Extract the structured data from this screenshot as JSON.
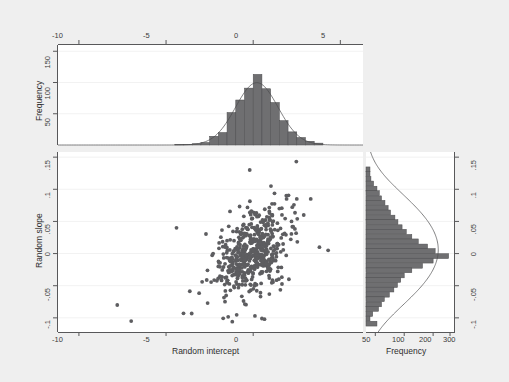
{
  "figure": {
    "background_color": "#efefef",
    "panel_color": "#ffffff",
    "axis_color": "#58585a",
    "marker_color": "#5d5d60",
    "bar_fill": "#6f6f71",
    "bar_stroke": "#4c4c4e"
  },
  "labels": {
    "x_axis_title": "Random intercept",
    "y_axis_title": "Random slope",
    "top_y_title": "Frequency",
    "right_x_title": "Frequency",
    "x_ticks": [
      "-10",
      "-5",
      "0",
      "5"
    ],
    "y_ticks": [
      ".15",
      ".1",
      ".05",
      "0",
      "-.05",
      "-.1"
    ],
    "top_y_ticks": [
      "50",
      "100",
      "150"
    ],
    "right_x_ticks": [
      "50",
      "100",
      "200",
      "300"
    ]
  },
  "chart_data": {
    "type": "scatter",
    "title": "",
    "xlabel": "Random intercept",
    "ylabel": "Random slope",
    "xlim": [
      -11.2,
      6.3
    ],
    "ylim": [
      -0.122,
      0.158
    ],
    "grid": "horizontal-faint",
    "legend": "none",
    "panels": [
      {
        "name": "top-marginal-histogram",
        "type": "bar",
        "orientation": "vertical",
        "variable": "Random intercept",
        "ylabel": "Frequency",
        "ylim": [
          0,
          160
        ],
        "y_ticks": [
          50,
          100,
          150
        ],
        "bin_width": 0.5,
        "bin_centers": [
          -4.25,
          -3.75,
          -3.25,
          -2.75,
          -2.25,
          -1.75,
          -1.25,
          -0.75,
          -0.25,
          0.25,
          0.75,
          1.25,
          1.75,
          2.25,
          2.75,
          3.25,
          3.75
        ],
        "values": [
          1,
          1,
          2,
          4,
          14,
          20,
          52,
          72,
          91,
          113,
          90,
          68,
          39,
          21,
          12,
          6,
          3
        ],
        "density_overlay": "normal"
      },
      {
        "name": "right-marginal-histogram",
        "type": "bar",
        "orientation": "horizontal",
        "variable": "Random slope",
        "xlabel": "Frequency",
        "x_scale": "log",
        "x_ticks": [
          50,
          100,
          200,
          300
        ],
        "xlim": [
          40,
          330
        ],
        "bin_width": 0.0075,
        "bin_centers": [
          0.131,
          0.124,
          0.116,
          0.109,
          0.101,
          0.094,
          0.086,
          0.079,
          0.071,
          0.064,
          0.056,
          0.049,
          0.041,
          0.034,
          0.026,
          0.019,
          0.011,
          0.004,
          -0.004,
          -0.011,
          -0.019,
          -0.026,
          -0.034,
          -0.041,
          -0.049,
          -0.056,
          -0.064,
          -0.071,
          -0.079,
          -0.086,
          -0.094,
          -0.101,
          -0.109
        ],
        "values": [
          44,
          44,
          45,
          48,
          52,
          55,
          58,
          63,
          68,
          72,
          80,
          86,
          95,
          105,
          120,
          140,
          175,
          210,
          290,
          200,
          155,
          120,
          100,
          92,
          85,
          78,
          70,
          62,
          58,
          54,
          47,
          44,
          52
        ],
        "density_overlay": "normal"
      },
      {
        "name": "scatter-panel",
        "type": "scatter",
        "x": [
          -7.8,
          -7.0,
          -4.4,
          -4.0,
          -1.2,
          0.1,
          0.5,
          -0.2,
          -2.3,
          -2.0,
          -1.6,
          -1.1,
          -0.9,
          -0.7,
          -0.5,
          -0.35,
          -0.2,
          -0.1,
          0.0,
          0.1,
          0.2,
          0.3,
          0.45,
          0.6,
          0.75,
          0.9,
          1.1,
          1.3,
          1.5,
          1.7,
          1.9,
          2.2,
          2.5,
          2.9,
          3.3,
          3.8,
          4.3
        ],
        "y": [
          -0.08,
          -0.105,
          0.04,
          -0.093,
          -0.106,
          -0.097,
          -0.101,
          0.13,
          0.0,
          -0.02,
          0.01,
          0.02,
          -0.03,
          0.03,
          -0.01,
          0.04,
          0.0,
          -0.02,
          0.005,
          0.02,
          -0.015,
          0.03,
          0.01,
          -0.005,
          0.045,
          0.02,
          0.06,
          0.0,
          0.07,
          0.03,
          0.09,
          0.05,
          0.085,
          0.06,
          0.085,
          0.01,
          0.005
        ],
        "n_points_approx": 520,
        "cluster_center": [
          0.0,
          0.0
        ],
        "correlation": "positive"
      }
    ]
  }
}
